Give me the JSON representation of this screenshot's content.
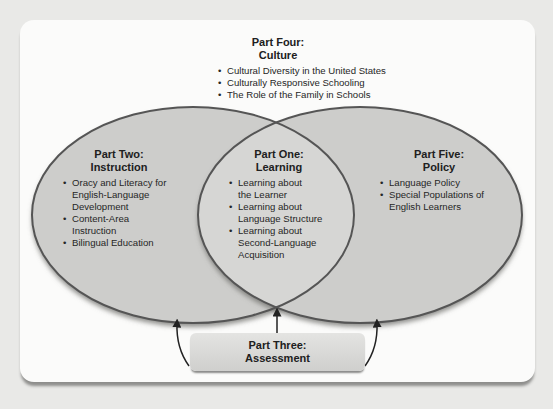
{
  "colors": {
    "background": "#e9e9e7",
    "panel": "#fbfbfa",
    "ellipse_fill": "#cfcfcd",
    "ellipse_stroke": "#555555",
    "text": "#202020"
  },
  "part_four": {
    "title_line1": "Part Four:",
    "title_line2": "Culture",
    "items": [
      "Cultural Diversity in the United States",
      "Culturally Responsive Schooling",
      "The Role of the Family in Schools"
    ]
  },
  "part_two": {
    "title_line1": "Part Two:",
    "title_line2": "Instruction",
    "items": [
      "Oracy and Literacy for English-Language Development",
      "Content-Area Instruction",
      "Bilingual Education"
    ]
  },
  "part_one": {
    "title_line1": "Part One:",
    "title_line2": "Learning",
    "items": [
      "Learning about the Learner",
      "Learning about Language Structure",
      "Learning about Second-Language Acquisition"
    ]
  },
  "part_five": {
    "title_line1": "Part Five:",
    "title_line2": "Policy",
    "items": [
      "Language Policy",
      "Special Populations of English Learners"
    ]
  },
  "part_three": {
    "title_line1": "Part Three:",
    "title_line2": "Assessment"
  }
}
